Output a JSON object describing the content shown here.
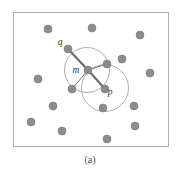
{
  "figure": {
    "caption": "(a)",
    "colors": {
      "dot_fill": "#8c8c8c",
      "dot_stroke": "#7a7a7a",
      "circle_stroke": "#9a9a9a",
      "frame_stroke": "#b0b0b0",
      "edge_stroke": "#6e6e6e",
      "label_color": "#3a3a3a",
      "background": "#ffffff"
    },
    "frame": {
      "x": 13,
      "y": 12,
      "width": 155,
      "height": 134
    },
    "labels": [
      {
        "id": "q",
        "text": "q",
        "x": 60,
        "y": 45
      },
      {
        "id": "m",
        "text": "m",
        "x": 76,
        "y": 73
      },
      {
        "id": "p",
        "text": "p",
        "x": 110,
        "y": 95
      }
    ],
    "points": [
      {
        "id": "q",
        "x": 68,
        "y": 49,
        "r": 4.0,
        "key": true
      },
      {
        "id": "m",
        "x": 88,
        "y": 70,
        "r": 4.0,
        "key": true
      },
      {
        "id": "p",
        "x": 105,
        "y": 89,
        "r": 4.0,
        "key": true
      },
      {
        "id": "n1",
        "x": 107,
        "y": 64,
        "r": 4.0,
        "key": true
      },
      {
        "id": "n2",
        "x": 72,
        "y": 89,
        "r": 4.0,
        "key": true
      },
      {
        "id": "d1",
        "x": 48,
        "y": 29,
        "r": 4.0,
        "key": false
      },
      {
        "id": "d2",
        "x": 92,
        "y": 28,
        "r": 4.0,
        "key": false
      },
      {
        "id": "d3",
        "x": 140,
        "y": 35,
        "r": 4.0,
        "key": false
      },
      {
        "id": "d4",
        "x": 122,
        "y": 59,
        "r": 4.0,
        "key": false
      },
      {
        "id": "d5",
        "x": 150,
        "y": 73,
        "r": 4.0,
        "key": false
      },
      {
        "id": "d6",
        "x": 38,
        "y": 79,
        "r": 4.0,
        "key": false
      },
      {
        "id": "d7",
        "x": 103,
        "y": 108,
        "r": 4.0,
        "key": false
      },
      {
        "id": "d8",
        "x": 134,
        "y": 106,
        "r": 4.0,
        "key": false
      },
      {
        "id": "d9",
        "x": 53,
        "y": 106,
        "r": 4.0,
        "key": false
      },
      {
        "id": "d10",
        "x": 31,
        "y": 122,
        "r": 4.0,
        "key": false
      },
      {
        "id": "d11",
        "x": 135,
        "y": 126,
        "r": 4.0,
        "key": false
      },
      {
        "id": "d12",
        "x": 62,
        "y": 131,
        "r": 4.0,
        "key": false
      },
      {
        "id": "d13",
        "x": 107,
        "y": 139,
        "r": 4.0,
        "key": false
      }
    ],
    "circles": [
      {
        "id": "circle-q-range",
        "cx": 87,
        "cy": 70,
        "r": 22.5
      },
      {
        "id": "circle-p-range",
        "cx": 105,
        "cy": 88,
        "r": 23.5
      }
    ],
    "edges": [
      {
        "id": "edge-q-m",
        "x1": 68,
        "y1": 49,
        "x2": 88,
        "y2": 70,
        "weight": "thick"
      },
      {
        "id": "edge-m-p",
        "x1": 88,
        "y1": 70,
        "x2": 105,
        "y2": 89,
        "weight": "thick"
      },
      {
        "id": "edge-m-n1",
        "x1": 88,
        "y1": 70,
        "x2": 107,
        "y2": 64,
        "weight": "thin"
      },
      {
        "id": "edge-m-n2",
        "x1": 88,
        "y1": 70,
        "x2": 72,
        "y2": 89,
        "weight": "thin"
      }
    ]
  }
}
